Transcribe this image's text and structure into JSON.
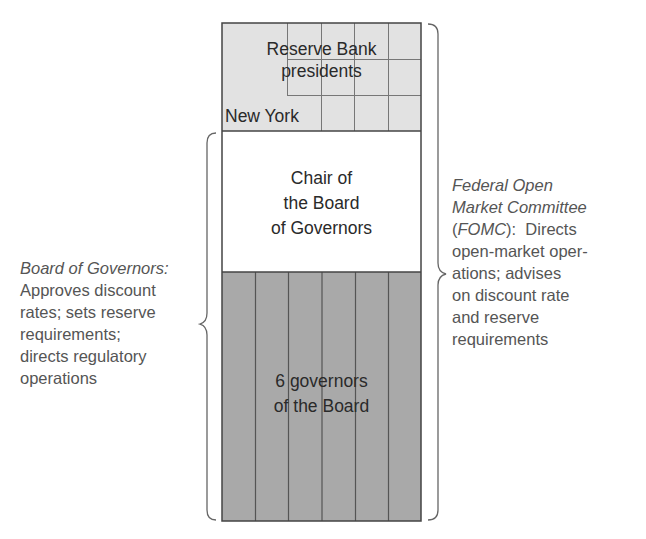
{
  "diagram": {
    "colors": {
      "reserve_bank_fill": "#e2e2e2",
      "chair_fill": "#ffffff",
      "governors_fill": "#a9a9a9",
      "outline": "#444444",
      "grid_line": "#777777",
      "annotation_text": "#555555",
      "box_text": "#2a2a2a"
    },
    "sections": [
      {
        "id": "reserve-bank-presidents",
        "lines": [
          "Reserve Bank",
          "presidents"
        ],
        "sub_label": "New York"
      },
      {
        "id": "chair",
        "lines": [
          "Chair of",
          "the Board",
          "of Governors"
        ]
      },
      {
        "id": "governors",
        "lines": [
          "6 governors",
          "of the Board"
        ]
      }
    ],
    "left_annotation": {
      "title": "Board of Governors:",
      "lines": [
        "Approves discount",
        "rates; sets reserve",
        "requirements;",
        "directs regulatory",
        "operations"
      ]
    },
    "right_annotation": {
      "title_lines": [
        "Federal Open",
        "Market Committee"
      ],
      "abbrev_open": "(",
      "abbrev": "FOMC",
      "abbrev_close": "):  Directs",
      "lines": [
        "open-market oper-",
        "ations; advises",
        "on discount rate",
        "and reserve",
        "requirements"
      ]
    }
  }
}
